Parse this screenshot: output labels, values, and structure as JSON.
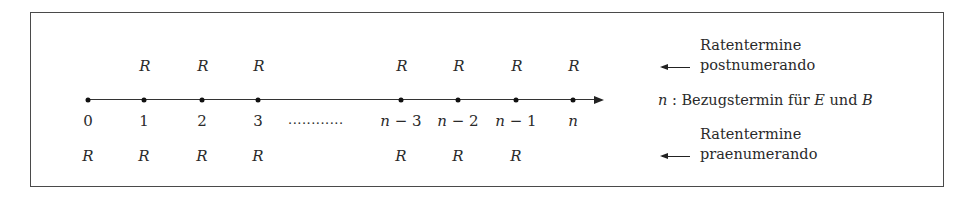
{
  "diagram": {
    "type": "timeline",
    "points": [
      {
        "label": "0",
        "x": 88,
        "post": "",
        "prae": "R"
      },
      {
        "label": "1",
        "x": 144,
        "post": "R",
        "prae": "R"
      },
      {
        "label": "2",
        "x": 202,
        "post": "R",
        "prae": "R"
      },
      {
        "label": "3",
        "x": 258,
        "post": "R",
        "prae": "R"
      },
      {
        "label": "n − 3",
        "x": 401,
        "post": "R",
        "prae": "R"
      },
      {
        "label": "n − 2",
        "x": 458,
        "post": "R",
        "prae": "R"
      },
      {
        "label": "n − 1",
        "x": 516,
        "post": "R",
        "prae": "R"
      },
      {
        "label": "n",
        "x": 573,
        "post": "R",
        "prae": ""
      }
    ],
    "ellipsis": "............",
    "legend": {
      "postnumerando": {
        "line1": "Ratentermine",
        "line2": "postnumerando"
      },
      "reference": {
        "var": "n",
        "sep": " : ",
        "text": "Bezugstermin für ",
        "e": "E",
        "und": " und ",
        "b": "B"
      },
      "praenumerando": {
        "line1": "Ratentermine",
        "line2": "praenumerando"
      }
    }
  }
}
